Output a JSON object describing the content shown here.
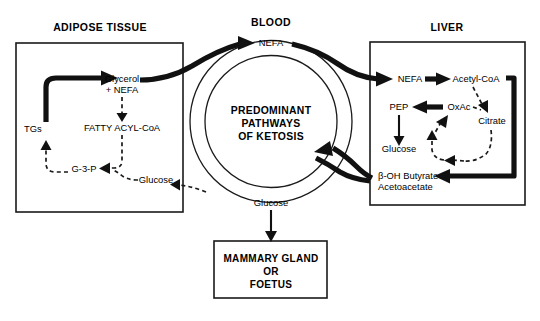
{
  "figure": {
    "title": "Predominant pathways of ketosis",
    "compartments": {
      "adipose": {
        "heading": "ADIPOSE TISSUE"
      },
      "blood": {
        "heading": "BLOOD"
      },
      "liver": {
        "heading": "LIVER"
      }
    }
  },
  "blood_ring": {
    "center_text_lines": [
      "PREDOMINANT",
      "PATHWAYS",
      "OF KETOSIS"
    ],
    "top_metabolite": "NEFA",
    "bottom_metabolite": "Glucose"
  },
  "adipose": {
    "nodes": {
      "tgs": "TGs",
      "glycerol_line1": "Glycerol",
      "glycerol_line2": "+ NEFA",
      "fatty_acyl_coa": "FATTY ACYL-CoA",
      "g3p": "G-3-P",
      "glucose": "Glucose"
    }
  },
  "liver": {
    "nodes": {
      "nefa": "NEFA",
      "acetyl_coa": "Acetyl-CoA",
      "pep": "PEP",
      "oxac": "OxAc",
      "citrate": "Citrate",
      "glucose": "Glucose",
      "ketones_line1": "β-OH Butyrate",
      "ketones_line2": "Acetoacetate"
    }
  },
  "target_box": {
    "lines": [
      "MAMMARY GLAND",
      "OR",
      "FOETUS"
    ]
  },
  "colors": {
    "ink": "#111111",
    "background": "#ffffff"
  }
}
